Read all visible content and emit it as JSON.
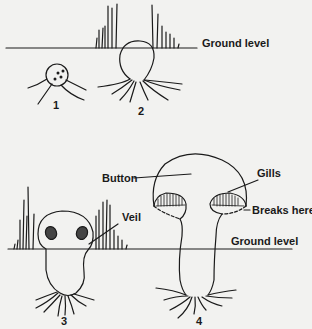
{
  "diagram": {
    "labels": {
      "ground_level_top": "Ground level",
      "ground_level_bottom": "Ground level",
      "button": "Button",
      "gills": "Gills",
      "veil": "Veil",
      "breaks_here": "Breaks here"
    },
    "stages": [
      {
        "number": "1"
      },
      {
        "number": "2"
      },
      {
        "number": "3"
      },
      {
        "number": "4"
      }
    ],
    "colors": {
      "background": "#f2f2f0",
      "ink": "#1a1a1a"
    }
  }
}
